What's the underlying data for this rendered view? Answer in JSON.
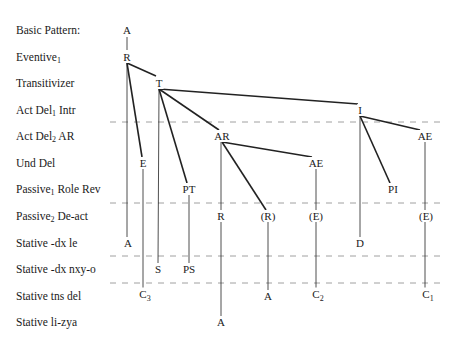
{
  "rows": [
    {
      "label": "Basic Pattern:",
      "sub": "",
      "label_rest": "",
      "y": 30
    },
    {
      "label": "Eventive",
      "sub": "1",
      "label_rest": "",
      "y": 57
    },
    {
      "label": "Transitivizer",
      "sub": "",
      "label_rest": "",
      "y": 83
    },
    {
      "label": "Act Del",
      "sub": "1",
      "label_rest": " Intr",
      "y": 110
    },
    {
      "label": "Act Del",
      "sub": "2",
      "label_rest": " AR",
      "y": 136
    },
    {
      "label": "Und Del",
      "sub": "",
      "label_rest": "",
      "y": 163
    },
    {
      "label": "Passive",
      "sub": "1",
      "label_rest": " Role Rev",
      "y": 189
    },
    {
      "label": "Passive",
      "sub": "2",
      "label_rest": " De-act",
      "y": 216
    },
    {
      "label": "Stative -dx le",
      "sub": "",
      "label_rest": "",
      "y": 243
    },
    {
      "label": "Stative -dx nxy-o",
      "sub": "",
      "label_rest": "",
      "y": 269
    },
    {
      "label": "Stative tns del",
      "sub": "",
      "label_rest": "",
      "y": 296
    },
    {
      "label": "Stative li-zya",
      "sub": "",
      "label_rest": "",
      "y": 322
    }
  ],
  "nodes": [
    {
      "id": "A0",
      "text": "A",
      "sub": "",
      "x": 127,
      "y": 30
    },
    {
      "id": "R",
      "text": "R",
      "sub": "",
      "x": 127,
      "y": 57
    },
    {
      "id": "T",
      "text": "T",
      "sub": "",
      "x": 159,
      "y": 83
    },
    {
      "id": "I",
      "text": "I",
      "sub": "",
      "x": 360,
      "y": 110
    },
    {
      "id": "AR",
      "text": "AR",
      "sub": "",
      "x": 222,
      "y": 136
    },
    {
      "id": "AE1",
      "text": "AE",
      "sub": "",
      "x": 425,
      "y": 136
    },
    {
      "id": "E",
      "text": "E",
      "sub": "",
      "x": 143,
      "y": 163
    },
    {
      "id": "AE2",
      "text": "AE",
      "sub": "",
      "x": 316,
      "y": 163
    },
    {
      "id": "PT",
      "text": "PT",
      "sub": "",
      "x": 189,
      "y": 189
    },
    {
      "id": "PI",
      "text": "PI",
      "sub": "",
      "x": 393,
      "y": 189
    },
    {
      "id": "R2",
      "text": "R",
      "sub": "",
      "x": 221,
      "y": 216
    },
    {
      "id": "Rp",
      "text": "(R)",
      "sub": "",
      "x": 268,
      "y": 216
    },
    {
      "id": "Ep1",
      "text": "(E)",
      "sub": "",
      "x": 316,
      "y": 216
    },
    {
      "id": "Ep2",
      "text": "(E)",
      "sub": "",
      "x": 426,
      "y": 216
    },
    {
      "id": "A1",
      "text": "A",
      "sub": "",
      "x": 128,
      "y": 243
    },
    {
      "id": "D",
      "text": "D",
      "sub": "",
      "x": 360,
      "y": 243
    },
    {
      "id": "S",
      "text": "S",
      "sub": "",
      "x": 158,
      "y": 269
    },
    {
      "id": "PS",
      "text": "PS",
      "sub": "",
      "x": 189,
      "y": 269
    },
    {
      "id": "C3",
      "text": "C",
      "sub": "3",
      "x": 145,
      "y": 296
    },
    {
      "id": "A2",
      "text": "A",
      "sub": "",
      "x": 268,
      "y": 296
    },
    {
      "id": "C2",
      "text": "C",
      "sub": "2",
      "x": 318,
      "y": 296
    },
    {
      "id": "C1",
      "text": "C",
      "sub": "1",
      "x": 428,
      "y": 296
    },
    {
      "id": "A3",
      "text": "A",
      "sub": "",
      "x": 221,
      "y": 322
    }
  ],
  "edges": [
    {
      "from": [
        127,
        37
      ],
      "to": [
        127,
        50
      ],
      "heavy": false
    },
    {
      "from": [
        127,
        63
      ],
      "to": [
        156,
        76
      ],
      "heavy": true
    },
    {
      "from": [
        127,
        63
      ],
      "to": [
        142,
        157
      ],
      "heavy": true
    },
    {
      "from": [
        127,
        63
      ],
      "to": [
        127,
        237
      ],
      "heavy": false
    },
    {
      "from": [
        159,
        89
      ],
      "to": [
        358,
        104
      ],
      "heavy": true
    },
    {
      "from": [
        159,
        89
      ],
      "to": [
        219,
        130
      ],
      "heavy": true
    },
    {
      "from": [
        159,
        89
      ],
      "to": [
        187,
        183
      ],
      "heavy": true
    },
    {
      "from": [
        159,
        89
      ],
      "to": [
        158,
        263
      ],
      "heavy": false
    },
    {
      "from": [
        143,
        169
      ],
      "to": [
        143,
        290
      ],
      "heavy": false
    },
    {
      "from": [
        360,
        116
      ],
      "to": [
        420,
        130
      ],
      "heavy": true
    },
    {
      "from": [
        360,
        116
      ],
      "to": [
        390,
        183
      ],
      "heavy": true
    },
    {
      "from": [
        360,
        116
      ],
      "to": [
        360,
        237
      ],
      "heavy": false
    },
    {
      "from": [
        222,
        142
      ],
      "to": [
        312,
        157
      ],
      "heavy": true
    },
    {
      "from": [
        222,
        142
      ],
      "to": [
        266,
        210
      ],
      "heavy": true
    },
    {
      "from": [
        221,
        142
      ],
      "to": [
        221,
        210
      ],
      "heavy": false
    },
    {
      "from": [
        189,
        195
      ],
      "to": [
        189,
        263
      ],
      "heavy": false
    },
    {
      "from": [
        316,
        169
      ],
      "to": [
        316,
        210
      ],
      "heavy": false
    },
    {
      "from": [
        425,
        142
      ],
      "to": [
        425,
        210
      ],
      "heavy": false
    },
    {
      "from": [
        221,
        222
      ],
      "to": [
        221,
        316
      ],
      "heavy": false
    },
    {
      "from": [
        268,
        222
      ],
      "to": [
        268,
        290
      ],
      "heavy": false
    },
    {
      "from": [
        316,
        222
      ],
      "to": [
        316,
        290
      ],
      "heavy": false
    },
    {
      "from": [
        425,
        222
      ],
      "to": [
        425,
        290
      ],
      "heavy": false
    }
  ],
  "dashed_lines": [
    {
      "y": 122,
      "x1": 110,
      "x2": 440
    },
    {
      "y": 203,
      "x1": 110,
      "x2": 440
    },
    {
      "y": 256,
      "x1": 110,
      "x2": 440
    },
    {
      "y": 283,
      "x1": 110,
      "x2": 440
    }
  ]
}
